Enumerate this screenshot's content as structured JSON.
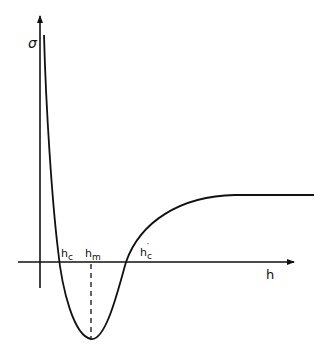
{
  "diagram": {
    "type": "potential-curve",
    "y_axis_label": "σ",
    "x_axis_label": "h",
    "points": [
      {
        "label_main": "h",
        "label_sub": "c",
        "prime": "",
        "description": "first zero crossing"
      },
      {
        "label_main": "h",
        "label_sub": "m",
        "prime": "",
        "description": "minimum"
      },
      {
        "label_main": "h",
        "label_sub": "c",
        "prime": "′",
        "description": "second zero crossing"
      }
    ],
    "colors": {
      "stroke": "#111111",
      "background": "#ffffff"
    }
  }
}
